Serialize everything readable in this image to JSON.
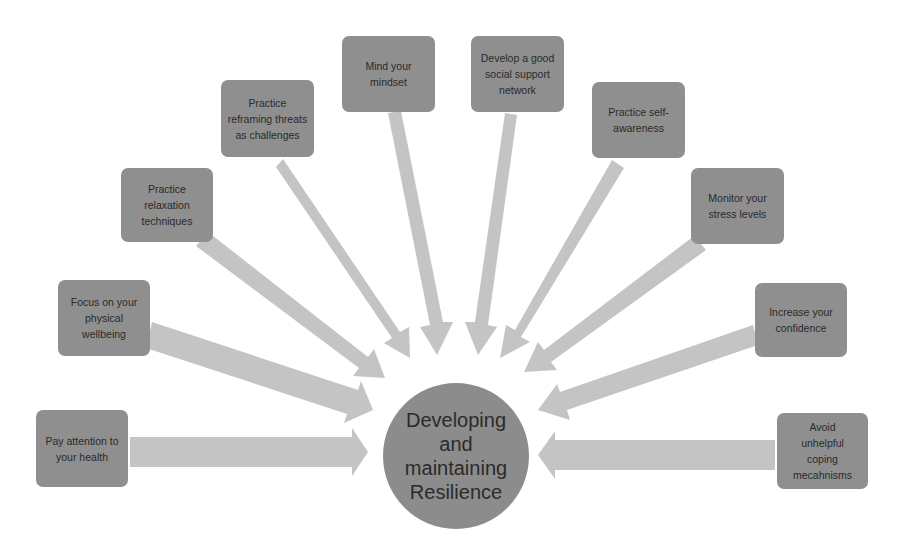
{
  "diagram": {
    "title": "Developing and maintaining Resilience",
    "center": {
      "label": "Developing and maintaining Resilience",
      "lines": [
        "Developing",
        "and",
        "maintaining",
        "Resilience"
      ],
      "color": "#8c8c8c"
    },
    "colors": {
      "box_fill": "#8f8f8f",
      "arrow_fill": "#c4c4c4",
      "text": "#2a2a2a",
      "background": "#ffffff"
    },
    "nodes": [
      {
        "id": "health",
        "label": "Pay attention to your health"
      },
      {
        "id": "physical",
        "label": "Focus on your physical wellbeing"
      },
      {
        "id": "relaxation",
        "label": "Practice relaxation techniques"
      },
      {
        "id": "reframing",
        "label": "Practice reframing threats as challenges"
      },
      {
        "id": "mindset",
        "label": "Mind your mindset"
      },
      {
        "id": "social",
        "label": "Develop a good social support network"
      },
      {
        "id": "self-awareness",
        "label": "Practice self-awareness"
      },
      {
        "id": "stress",
        "label": "Monitor your stress levels"
      },
      {
        "id": "confidence",
        "label": "Increase your confidence"
      },
      {
        "id": "coping",
        "label": "Avoid unhelpful coping mecahnisms"
      }
    ]
  }
}
